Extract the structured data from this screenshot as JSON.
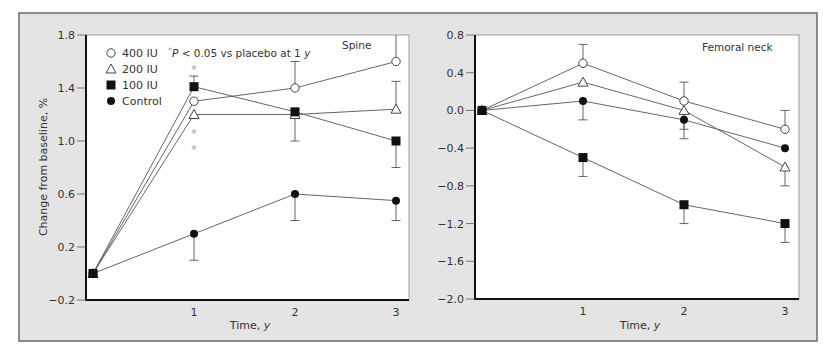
{
  "figure": {
    "panels": [
      {
        "title": "Spine",
        "ylabel": "Change from baseline, %",
        "xlabel_prefix": "Time, ",
        "xlabel_unit": "y",
        "yticks": [
          "1.8",
          "1.4",
          "1.0",
          "0.6",
          "0.2",
          "−0.2"
        ],
        "xticks": [
          "1",
          "2",
          "3"
        ]
      },
      {
        "title": "Femoral neck",
        "ylabel": "",
        "xlabel_prefix": "Time, ",
        "xlabel_unit": "y",
        "yticks": [
          "0.8",
          "0.4",
          "0.0",
          "−0.4",
          "−0.8",
          "−1.2",
          "−1.6",
          "−2.0"
        ],
        "xticks": [
          "1",
          "2",
          "3"
        ]
      }
    ],
    "legend": [
      {
        "label": "400 IU",
        "marker": "open-circle"
      },
      {
        "label": "200 IU",
        "marker": "open-triangle"
      },
      {
        "label": "100 IU",
        "marker": "filled-square"
      },
      {
        "label": "Control",
        "marker": "filled-circle"
      }
    ],
    "note": {
      "star": "*",
      "p": "P",
      "text": " < 0.05 vs placebo at 1 ",
      "unit": "y"
    },
    "colors": {
      "panel_background": "#e4e4e4",
      "frame": "#6a6a6a",
      "plot_background": "#ffffff",
      "axis": "#111111",
      "line": "#555555",
      "filled_marker": "#111111",
      "asterisk": "#9a9a9a"
    }
  },
  "chart_data": [
    {
      "type": "line",
      "title": "Spine",
      "xlabel": "Time, y",
      "ylabel": "Change from baseline, %",
      "x": [
        0,
        1,
        2,
        3
      ],
      "xticks": [
        1,
        2,
        3
      ],
      "ylim": [
        -0.2,
        1.8
      ],
      "yticks": [
        1.8,
        1.4,
        1.0,
        0.6,
        0.2,
        -0.2
      ],
      "grid": false,
      "legend_position": "upper left",
      "series": [
        {
          "name": "400 IU",
          "marker": "open-circle",
          "values": [
            0,
            1.3,
            1.4,
            1.6
          ],
          "error_bars": [
            {
              "x": 2,
              "to": 1.6
            },
            {
              "x": 3,
              "to": 1.8,
              "clipped": true
            }
          ]
        },
        {
          "name": "200 IU",
          "marker": "open-triangle",
          "values": [
            0,
            1.2,
            1.2,
            1.24
          ],
          "error_bars": [
            {
              "x": 3,
              "to": 1.45
            }
          ]
        },
        {
          "name": "100 IU",
          "marker": "filled-square",
          "values": [
            0,
            1.41,
            1.22,
            1.0
          ],
          "error_bars": [
            {
              "x": 1,
              "to": 1.49
            },
            {
              "x": 2,
              "to": 1.0
            },
            {
              "x": 3,
              "to": 0.8
            }
          ]
        },
        {
          "name": "Control",
          "marker": "filled-circle",
          "values": [
            0,
            0.3,
            0.6,
            0.55
          ],
          "error_bars": [
            {
              "x": 1,
              "to": 0.1
            },
            {
              "x": 2,
              "to": 0.4
            },
            {
              "x": 3,
              "to": 0.4
            }
          ]
        }
      ],
      "annotations": [
        {
          "text": "*",
          "x": 1,
          "y": 1.55
        },
        {
          "text": "*",
          "x": 1,
          "y": 1.07
        },
        {
          "text": "*",
          "x": 1,
          "y": 0.95
        },
        {
          "text": "*P < 0.05 vs placebo at 1 y"
        }
      ]
    },
    {
      "type": "line",
      "title": "Femoral neck",
      "xlabel": "Time, y",
      "ylabel": "",
      "x": [
        0,
        1,
        2,
        3
      ],
      "xticks": [
        1,
        2,
        3
      ],
      "ylim": [
        -2.0,
        0.8
      ],
      "yticks": [
        0.8,
        0.4,
        0.0,
        -0.4,
        -0.8,
        -1.2,
        -1.6,
        -2.0
      ],
      "grid": false,
      "series": [
        {
          "name": "400 IU",
          "marker": "open-circle",
          "values": [
            0,
            0.5,
            0.1,
            -0.2
          ],
          "error_bars": [
            {
              "x": 1,
              "to": 0.7
            },
            {
              "x": 2,
              "to": 0.3
            },
            {
              "x": 3,
              "to": 0.0
            }
          ]
        },
        {
          "name": "200 IU",
          "marker": "open-triangle",
          "values": [
            0,
            0.3,
            0.0,
            -0.6
          ],
          "error_bars": [
            {
              "x": 2,
              "to": -0.2
            },
            {
              "x": 3,
              "to": -0.8
            }
          ]
        },
        {
          "name": "100 IU",
          "marker": "filled-square",
          "values": [
            0,
            -0.5,
            -1.0,
            -1.2
          ],
          "error_bars": [
            {
              "x": 1,
              "to": -0.7
            },
            {
              "x": 2,
              "to": -1.2
            },
            {
              "x": 3,
              "to": -1.4
            }
          ]
        },
        {
          "name": "Control",
          "marker": "filled-circle",
          "values": [
            0,
            0.1,
            -0.1,
            -0.4
          ],
          "error_bars": [
            {
              "x": 1,
              "to": -0.1
            },
            {
              "x": 2,
              "to": -0.3
            }
          ]
        }
      ],
      "annotations": []
    }
  ]
}
